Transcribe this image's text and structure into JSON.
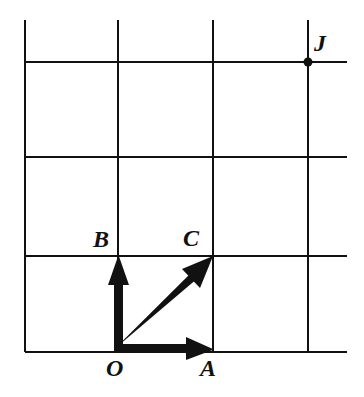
{
  "figure": {
    "type": "vector-diagram-on-grid",
    "background_color": "#ffffff",
    "ink_color": "#111111",
    "grid": {
      "columns": 4,
      "rows": 4,
      "vertical_line_x": [
        25,
        118,
        213,
        308
      ],
      "horizontal_line_y": [
        62,
        157,
        256,
        352
      ],
      "x_min": 25,
      "x_max": 347,
      "y_min": 20,
      "y_max": 352,
      "line_width_px": 2
    },
    "origin": {
      "x": 118,
      "y": 352
    },
    "cell_size": {
      "width": 94,
      "height": 96
    },
    "vectors": [
      {
        "name": "OA",
        "label": "A",
        "from": {
          "x": 118,
          "y": 352
        },
        "to": {
          "x": 213,
          "y": 352
        },
        "direction": "right",
        "label_pos": {
          "x": 200,
          "y": 356
        }
      },
      {
        "name": "OB",
        "label": "B",
        "from": {
          "x": 118,
          "y": 352
        },
        "to": {
          "x": 118,
          "y": 256
        },
        "direction": "up",
        "label_pos": {
          "x": 93,
          "y": 227
        }
      },
      {
        "name": "OC",
        "label": "C",
        "from": {
          "x": 118,
          "y": 352
        },
        "to": {
          "x": 213,
          "y": 256
        },
        "direction": "up-right-diagonal",
        "label_pos": {
          "x": 183,
          "y": 226
        }
      }
    ],
    "points": [
      {
        "name": "J",
        "label": "J",
        "at": {
          "x": 308,
          "y": 62
        },
        "dot_radius": 4,
        "label_pos": {
          "x": 314,
          "y": 31
        }
      },
      {
        "name": "O",
        "label": "O",
        "at": {
          "x": 118,
          "y": 352
        },
        "label_pos": {
          "x": 106,
          "y": 356
        }
      }
    ],
    "labels": {
      "A": "A",
      "B": "B",
      "C": "C",
      "J": "J",
      "O": "O"
    },
    "label_font_size_px": 24
  }
}
